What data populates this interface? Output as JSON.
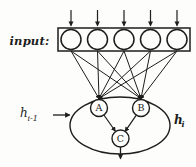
{
  "figure": {
    "input_label": "input:",
    "input_unit_count": "5",
    "nodes": {
      "a": "A",
      "b": "B",
      "c": "C"
    },
    "left_state": {
      "base": "h",
      "subscript": "i-1"
    },
    "right_state": {
      "base": "h",
      "subscript": "i"
    },
    "colors": {
      "ink": "#1d1d1d",
      "paper": "#fdfdfb"
    }
  }
}
